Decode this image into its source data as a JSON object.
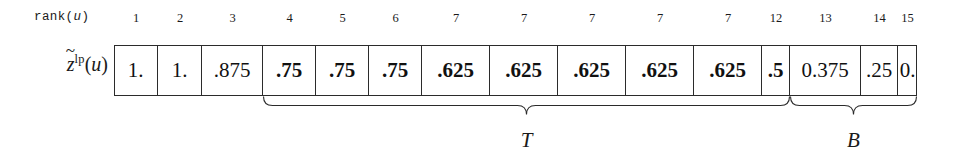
{
  "figure": {
    "row_header_label": "rank(u)",
    "row_header_label_prefix": "rank(",
    "row_header_label_var": "u",
    "row_header_label_suffix": ")",
    "value_row_label": {
      "variable": "z",
      "accent": "~",
      "superscript": "lp",
      "open_paren": "(",
      "argument": "u",
      "close_paren": ")"
    },
    "ranks": [
      "1",
      "2",
      "3",
      "4",
      "5",
      "6",
      "7",
      "7",
      "7",
      "7",
      "7",
      "12",
      "13",
      "14",
      "15"
    ],
    "values": [
      "1.",
      "1.",
      ".875",
      ".75",
      ".75",
      ".75",
      ".625",
      ".625",
      ".625",
      ".625",
      ".625",
      ".5",
      "0.375",
      ".25",
      "0."
    ],
    "value_bold": [
      false,
      false,
      false,
      true,
      true,
      true,
      true,
      true,
      true,
      true,
      true,
      true,
      false,
      false,
      false
    ],
    "braces": [
      {
        "label": "T",
        "start_cell_index": 3,
        "end_cell_index": 11
      },
      {
        "label": "B",
        "start_cell_index": 12,
        "end_cell_index": 14
      }
    ],
    "colors": {
      "border": "#2b2b2b",
      "text": "#1a1a1a",
      "background": "#ffffff"
    }
  }
}
